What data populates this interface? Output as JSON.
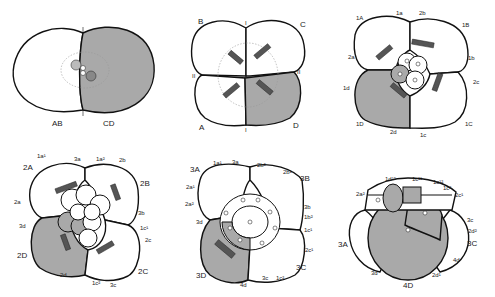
{
  "figure": {
    "shaded_color": "#a9a9a9",
    "outline_color": "#111111",
    "panels": [
      {
        "id": "two-cell",
        "labels": {
          "left": "AB",
          "right": "CD"
        }
      },
      {
        "id": "four-cell",
        "labels": {
          "tl": "B",
          "tr": "C",
          "bl": "A",
          "br": "D",
          "top_mark": "I",
          "bottom_mark": "I",
          "left_mark": "II",
          "right_mark": "II"
        }
      },
      {
        "id": "eight-cell",
        "labels": {
          "1A": "1A",
          "1a": "1a",
          "2b": "2b",
          "1B": "1B",
          "2a": "2a",
          "1b": "1b",
          "2c": "2c",
          "1d": "1d",
          "1D": "1D",
          "2d": "2d",
          "1c": "1c",
          "1C": "1C",
          "mark_top": "II",
          "mark_bottom": "II",
          "mark_left": "I",
          "mark_right": "I"
        }
      },
      {
        "id": "sixteen-cell",
        "labels": {
          "1a1": "1a¹",
          "3a": "3a",
          "1a2": "1a²",
          "2b": "2b",
          "2A": "2A",
          "2B": "2B",
          "2a": "2a",
          "3b": "3b",
          "3d": "3d",
          "1c1": "1c¹",
          "2c": "2c",
          "2D": "2D",
          "2d": "2d",
          "2C": "2C",
          "1c2": "1c²",
          "3c": "3c",
          "mark": "II"
        }
      },
      {
        "id": "thirty-two-cell",
        "labels": {
          "3A": "3A",
          "1a1": "1a¹",
          "3a": "3a",
          "2b2": "2b²",
          "2b1": "2b¹",
          "3B": "3B",
          "2a1": "2a¹",
          "2a2": "2a²",
          "3b": "3b",
          "1b2": "1b²",
          "3d": "3d",
          "1c1": "1c¹",
          "2c1": "2c¹",
          "3C": "3C",
          "3D": "3D",
          "4d": "4d",
          "3c": "3c",
          "1c2": "1c²"
        }
      },
      {
        "id": "lateral-view",
        "labels": {
          "1d12": "1d¹²",
          "1c11": "1c¹¹",
          "1c12": "1c¹²",
          "1c2": "1c²",
          "2a2": "2a²",
          "2c1": "2c¹",
          "3c": "3c",
          "2d2": "2d²",
          "3A": "3A",
          "3C": "3C",
          "4d": "4d",
          "3d": "3d",
          "2d1": "2d¹",
          "4D": "4D"
        }
      }
    ]
  }
}
